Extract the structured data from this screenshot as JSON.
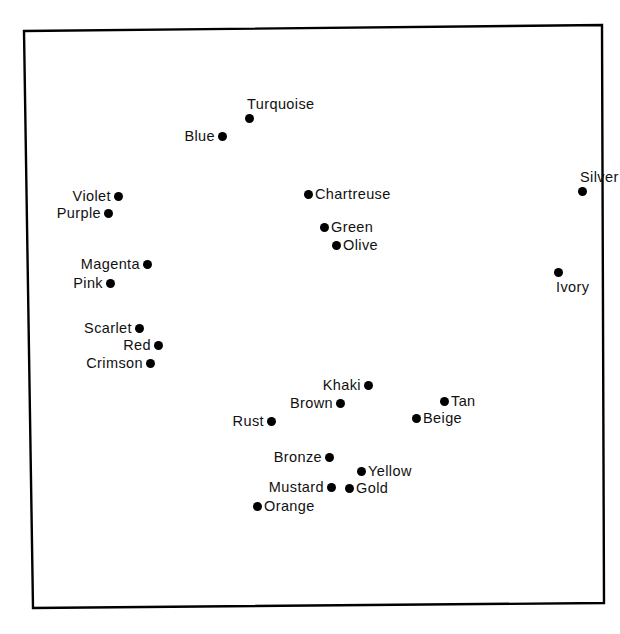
{
  "figure": {
    "kind": "scatter-plot",
    "background_color": "#ffffff",
    "ink_color": "#000000",
    "frame": {
      "visible": true,
      "style": "solid-rectangle-slightly-skewed",
      "line_color": "#000000",
      "line_width_px": 2.4,
      "corners": {
        "top_left": [
          24,
          31
        ],
        "top_right": [
          602,
          25
        ],
        "bottom_right": [
          604,
          603
        ],
        "bottom_left": [
          33,
          608
        ]
      }
    },
    "title": "",
    "subtitle": "",
    "xlabel": "",
    "ylabel": "",
    "axis_ticks_visible": false,
    "gridlines_visible": false,
    "legend_visible": false
  },
  "chart_data": {
    "type": "scatter",
    "title": "",
    "subtitle": "",
    "xlabel": "",
    "ylabel": "",
    "grid": false,
    "legend": "none",
    "axis_ticks": false,
    "xlim": [
      24,
      604
    ],
    "ylim": [
      608,
      25
    ],
    "units": "pixels",
    "point_marker": "filled-circle",
    "point_color": "#000000",
    "point_diameter_px": 9,
    "n_points": 22,
    "labels": [
      "Turquoise",
      "Blue",
      "Silver",
      "Violet",
      "Purple",
      "Chartreuse",
      "Green",
      "Olive",
      "Magenta",
      "Pink",
      "Ivory",
      "Scarlet",
      "Red",
      "Crimson",
      "Khaki",
      "Brown",
      "Tan",
      "Rust",
      "Beige",
      "Bronze",
      "Yellow",
      "Mustard",
      "Gold",
      "Orange"
    ],
    "x": [
      249,
      222,
      582,
      118,
      108,
      308,
      324,
      336,
      147,
      110,
      558,
      139,
      158,
      150,
      368,
      340,
      444,
      271,
      416,
      329,
      361,
      331,
      349,
      257
    ],
    "y": [
      118,
      136,
      191,
      196,
      213,
      194,
      227,
      245,
      264,
      283,
      272,
      328,
      345,
      363,
      385,
      403,
      401,
      421,
      418,
      457,
      471,
      487,
      488,
      506
    ],
    "points": [
      {
        "label": "Turquoise",
        "x": 249,
        "y": 118,
        "label_position": "above"
      },
      {
        "label": "Blue",
        "x": 222,
        "y": 136,
        "label_position": "left"
      },
      {
        "label": "Silver",
        "x": 582,
        "y": 191,
        "label_position": "above"
      },
      {
        "label": "Violet",
        "x": 118,
        "y": 196,
        "label_position": "left"
      },
      {
        "label": "Purple",
        "x": 108,
        "y": 213,
        "label_position": "left"
      },
      {
        "label": "Chartreuse",
        "x": 308,
        "y": 194,
        "label_position": "right"
      },
      {
        "label": "Green",
        "x": 324,
        "y": 227,
        "label_position": "right"
      },
      {
        "label": "Olive",
        "x": 336,
        "y": 245,
        "label_position": "right"
      },
      {
        "label": "Magenta",
        "x": 147,
        "y": 264,
        "label_position": "left"
      },
      {
        "label": "Pink",
        "x": 110,
        "y": 283,
        "label_position": "left"
      },
      {
        "label": "Ivory",
        "x": 558,
        "y": 272,
        "label_position": "below"
      },
      {
        "label": "Scarlet",
        "x": 139,
        "y": 328,
        "label_position": "left"
      },
      {
        "label": "Red",
        "x": 158,
        "y": 345,
        "label_position": "left"
      },
      {
        "label": "Crimson",
        "x": 150,
        "y": 363,
        "label_position": "left"
      },
      {
        "label": "Khaki",
        "x": 368,
        "y": 385,
        "label_position": "left"
      },
      {
        "label": "Brown",
        "x": 340,
        "y": 403,
        "label_position": "left"
      },
      {
        "label": "Tan",
        "x": 444,
        "y": 401,
        "label_position": "right"
      },
      {
        "label": "Rust",
        "x": 271,
        "y": 421,
        "label_position": "left"
      },
      {
        "label": "Beige",
        "x": 416,
        "y": 418,
        "label_position": "right"
      },
      {
        "label": "Bronze",
        "x": 329,
        "y": 457,
        "label_position": "left"
      },
      {
        "label": "Yellow",
        "x": 361,
        "y": 471,
        "label_position": "right"
      },
      {
        "label": "Mustard",
        "x": 331,
        "y": 487,
        "label_position": "left"
      },
      {
        "label": "Gold",
        "x": 349,
        "y": 488,
        "label_position": "right"
      },
      {
        "label": "Orange",
        "x": 257,
        "y": 506,
        "label_position": "right"
      }
    ]
  }
}
